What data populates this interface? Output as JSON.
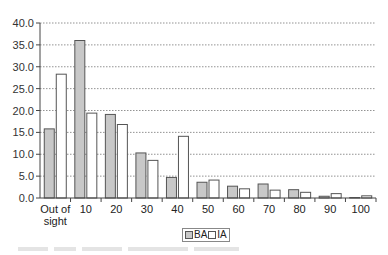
{
  "chart_data": {
    "type": "bar",
    "title": "",
    "xlabel": "",
    "ylabel": "",
    "ylim": [
      0,
      40
    ],
    "yticks": [
      "0.0",
      "5.0",
      "10.0",
      "15.0",
      "20.0",
      "25.0",
      "30.0",
      "35.0",
      "40.0"
    ],
    "grid": true,
    "legend_position": "bottom",
    "categories": [
      "Out of sight",
      "10",
      "20",
      "30",
      "40",
      "50",
      "60",
      "70",
      "80",
      "90",
      "100"
    ],
    "series": [
      {
        "name": "BA",
        "color": "#c8c8c8",
        "values": [
          15.8,
          36.0,
          19.1,
          10.3,
          4.7,
          3.6,
          2.7,
          3.2,
          1.9,
          0.4,
          0.1
        ]
      },
      {
        "name": "IA",
        "color": "#ffffff",
        "values": [
          28.3,
          19.4,
          16.8,
          8.6,
          14.1,
          4.1,
          2.1,
          1.8,
          1.3,
          1.0,
          0.5
        ]
      }
    ]
  },
  "legend": {
    "ba_label": "BA",
    "ia_label": "IA"
  }
}
